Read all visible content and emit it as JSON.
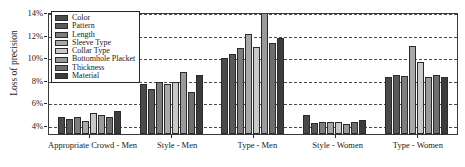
{
  "chart_data": {
    "type": "bar",
    "title": "",
    "xlabel": "",
    "ylabel": "Loss of precision",
    "ylim": [
      3.2,
      14.0
    ],
    "ytick_values": [
      4,
      6,
      8,
      10,
      12,
      14
    ],
    "ytick_labels": [
      "4%",
      "6%",
      "8%",
      "10%",
      "12%",
      "14%"
    ],
    "grid": true,
    "grid_axis": "y",
    "grid_style": "dashed",
    "legend_position": "upper left",
    "categories": [
      "Appropriate Crowd - Men",
      "Style - Men",
      "Type - Men",
      "Style - Women",
      "Type - Women"
    ],
    "series": [
      {
        "name": "Color",
        "color": "#4a4a4a",
        "values": [
          4.75,
          7.6,
          9.95,
          4.9,
          8.25
        ]
      },
      {
        "name": "Pattern",
        "color": "#595959",
        "values": [
          4.5,
          7.2,
          10.3,
          4.2,
          8.45
        ]
      },
      {
        "name": "Length",
        "color": "#7d7d7d",
        "values": [
          4.75,
          7.8,
          10.8,
          4.25,
          8.3
        ]
      },
      {
        "name": "Sleeve Type",
        "color": "#a8a8a8",
        "values": [
          4.35,
          7.6,
          12.05,
          4.25,
          11.0
        ]
      },
      {
        "name": "Collar Type",
        "color": "#c9c9c9",
        "values": [
          5.1,
          7.8,
          10.9,
          4.25,
          9.55
        ]
      },
      {
        "name": "Bottomhole Placket",
        "color": "#9a9a9a",
        "values": [
          4.85,
          8.7,
          13.95,
          4.05,
          8.25
        ]
      },
      {
        "name": "Thickness",
        "color": "#6e6e6e",
        "values": [
          4.7,
          6.9,
          11.25,
          4.3,
          8.45
        ]
      },
      {
        "name": "Material",
        "color": "#3c3c3c",
        "values": [
          5.2,
          8.4,
          11.7,
          4.4,
          8.25
        ]
      }
    ]
  }
}
